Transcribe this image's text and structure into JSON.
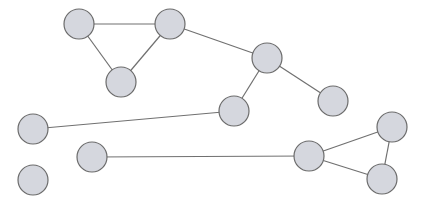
{
  "graph": {
    "node_radius": 15,
    "colors": {
      "node_fill": "#d5d7de",
      "node_stroke": "#6b6b6b",
      "edge": "#707070",
      "background": "#ffffff"
    },
    "nodes": [
      {
        "id": 1,
        "x": 79,
        "y": 24
      },
      {
        "id": 2,
        "x": 170,
        "y": 24
      },
      {
        "id": 3,
        "x": 121,
        "y": 82
      },
      {
        "id": 4,
        "x": 267,
        "y": 58
      },
      {
        "id": 5,
        "x": 333,
        "y": 101
      },
      {
        "id": 6,
        "x": 234,
        "y": 111
      },
      {
        "id": 7,
        "x": 33,
        "y": 129
      },
      {
        "id": 8,
        "x": 92,
        "y": 157
      },
      {
        "id": 9,
        "x": 33,
        "y": 180
      },
      {
        "id": 10,
        "x": 309,
        "y": 156
      },
      {
        "id": 11,
        "x": 392,
        "y": 127
      },
      {
        "id": 12,
        "x": 382,
        "y": 179
      }
    ],
    "edges": [
      [
        1,
        2
      ],
      [
        1,
        3
      ],
      [
        2,
        3
      ],
      [
        2,
        4
      ],
      [
        4,
        5
      ],
      [
        4,
        6
      ],
      [
        6,
        7
      ],
      [
        8,
        10
      ],
      [
        10,
        11
      ],
      [
        10,
        12
      ],
      [
        11,
        12
      ]
    ]
  }
}
